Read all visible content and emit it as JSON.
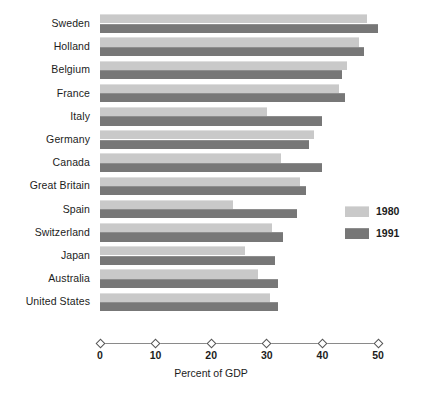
{
  "chart_data": {
    "type": "bar",
    "orientation": "horizontal",
    "title": "",
    "xlabel": "Percent of GDP",
    "ylabel": "",
    "xlim": [
      0,
      50
    ],
    "xticks": [
      0,
      10,
      20,
      30,
      40,
      50
    ],
    "xtick_labels": [
      "0",
      "10",
      "20",
      "30",
      "40",
      "50"
    ],
    "grid": false,
    "legend_position": "right",
    "categories": [
      "Sweden",
      "Holland",
      "Belgium",
      "France",
      "Italy",
      "Germany",
      "Canada",
      "Great Britain",
      "Spain",
      "Switzerland",
      "Japan",
      "Australia",
      "United States"
    ],
    "series": [
      {
        "name": "1980",
        "color": "#c9c9c9",
        "values": [
          48,
          46.5,
          44.5,
          43,
          30,
          38.5,
          32.5,
          36,
          24,
          31,
          26,
          28.5,
          30.5
        ]
      },
      {
        "name": "1991",
        "color": "#777777",
        "values": [
          50,
          47.5,
          43.5,
          44,
          40,
          37.5,
          40,
          37,
          35.5,
          33,
          31.5,
          32,
          32
        ]
      }
    ]
  },
  "legend": {
    "entries": [
      {
        "label": "1980",
        "color": "#c9c9c9"
      },
      {
        "label": "1991",
        "color": "#777777"
      }
    ]
  },
  "axis": {
    "title": "Percent of GDP"
  }
}
